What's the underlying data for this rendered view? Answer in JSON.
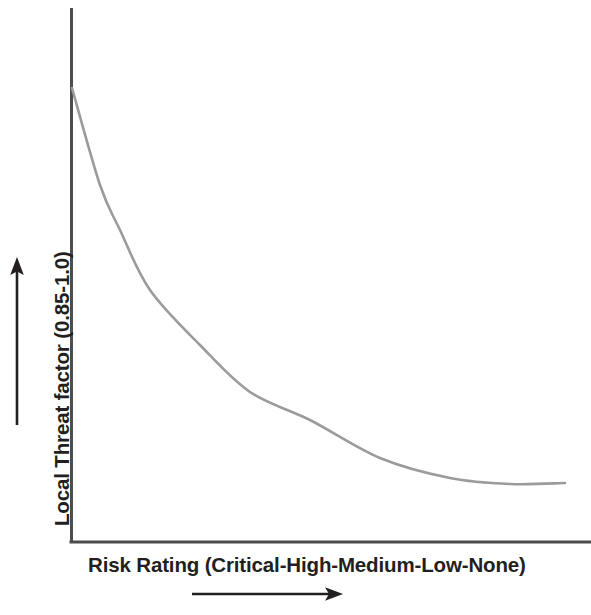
{
  "figure": {
    "background_color": "#ffffff",
    "axis_color": "#4d4d4d",
    "curve_color": "#9b9b9b",
    "text_color": "#231f20",
    "arrow_color": "#231f20"
  },
  "axes": {
    "x_label": "Risk Rating (Critical-High-Medium-Low-None)",
    "y_label": "Local Threat factor (0.85-1.0)",
    "x_direction_arrow": "right-arrow-icon",
    "y_direction_arrow": "up-arrow-icon"
  },
  "chart_data": {
    "type": "line",
    "title": "",
    "xlabel": "Risk Rating (Critical-High-Medium-Low-None)",
    "ylabel": "Local Threat factor (0.85-1.0)",
    "grid": false,
    "legend": "none",
    "x_categories": [
      "Critical",
      "High",
      "Medium",
      "Low",
      "None"
    ],
    "xlim": [
      0,
      1
    ],
    "ylim": [
      0.85,
      1.0
    ],
    "series": [
      {
        "name": "Local Threat factor",
        "comment": "Monotonically decreasing exponential decay from 1.0 at Critical risk to ~0.86 flattening at None",
        "x": [
          0.0,
          0.06,
          0.1,
          0.16,
          0.26,
          0.36,
          0.48,
          0.63,
          0.77,
          0.89,
          1.0
        ],
        "y": [
          1.0,
          0.979,
          0.969,
          0.956,
          0.944,
          0.934,
          0.928,
          0.92,
          0.916,
          0.914,
          0.914
        ],
        "pixel_path": [
          [
            72,
            88
          ],
          [
            100,
            185
          ],
          [
            120,
            230
          ],
          [
            150,
            290
          ],
          [
            200,
            345
          ],
          [
            250,
            392
          ],
          [
            310,
            420
          ],
          [
            380,
            458
          ],
          [
            450,
            478
          ],
          [
            510,
            484
          ],
          [
            565,
            483
          ]
        ]
      }
    ]
  },
  "geometry": {
    "y_axis_x": 71,
    "y_axis_top": 8,
    "x_axis_y": 542,
    "x_axis_right": 591,
    "x_arrow": {
      "x1": 192,
      "x2": 343,
      "y": 594
    },
    "y_arrow": {
      "y1": 425,
      "y2": 259,
      "x": 17
    }
  }
}
